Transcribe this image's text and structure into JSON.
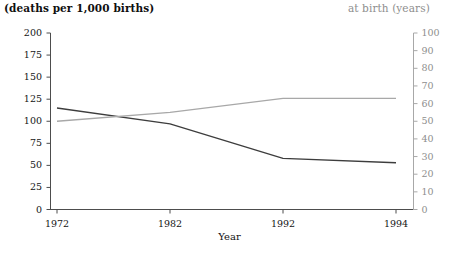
{
  "chart_data": {
    "type": "line",
    "title": "",
    "xlabel": "Year",
    "x": [
      1972,
      1982,
      1992,
      1994
    ],
    "xtick_labels": [
      "1972",
      "1982",
      "1992",
      "1994"
    ],
    "grid": false,
    "legend": "none",
    "left_axis": {
      "label": "(deaths per 1,000 births)",
      "ylim": [
        0,
        200
      ],
      "ticks": [
        0,
        25,
        50,
        75,
        100,
        125,
        150,
        175,
        200
      ],
      "tick_labels": [
        "0",
        "25",
        "50",
        "75",
        "100",
        "125",
        "150",
        "175",
        "200"
      ],
      "color": "#141414"
    },
    "right_axis": {
      "label": "at birth (years)",
      "ylim": [
        0,
        100
      ],
      "ticks": [
        0,
        10,
        20,
        30,
        40,
        50,
        60,
        70,
        80,
        90,
        100
      ],
      "tick_labels": [
        "0",
        "10",
        "20",
        "30",
        "40",
        "50",
        "60",
        "70",
        "80",
        "90",
        "100"
      ],
      "color": "#8e8e8e"
    },
    "series": [
      {
        "name": "deaths per 1,000 births",
        "axis": "left",
        "color": "#3d3d3d",
        "values": [
          115,
          97,
          58,
          53
        ]
      },
      {
        "name": "at birth (years)",
        "axis": "right",
        "color": "#a8a8a8",
        "values": [
          50,
          55,
          63,
          63
        ]
      }
    ]
  },
  "captions": {
    "left": "(deaths per 1,000 births)",
    "right": "at birth (years)",
    "xlabel": "Year"
  }
}
